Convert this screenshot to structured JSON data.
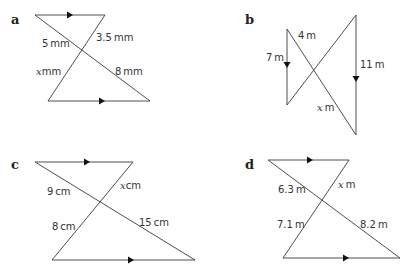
{
  "panels": [
    {
      "id": "a",
      "label": "a",
      "labels": {
        "l1": "5 mm",
        "l2": "3.5 mm",
        "l3_var": "x",
        "l3_unit": "mm",
        "l4": "8 mm"
      }
    },
    {
      "id": "b",
      "label": "b",
      "labels": {
        "l1": "4 m",
        "l2": "7 m",
        "l3": "11 m",
        "l4_var": "x",
        "l4_unit": " m"
      }
    },
    {
      "id": "c",
      "label": "c",
      "labels": {
        "l1": "9 cm",
        "l2_var": "x",
        "l2_unit": "cm",
        "l3": "8 cm",
        "l4": "15 cm"
      }
    },
    {
      "id": "d",
      "label": "d",
      "labels": {
        "l1": "6.3 m",
        "l2_var": "x",
        "l2_unit": " m",
        "l3": "7.1 m",
        "l4": "8.2 m"
      }
    }
  ]
}
